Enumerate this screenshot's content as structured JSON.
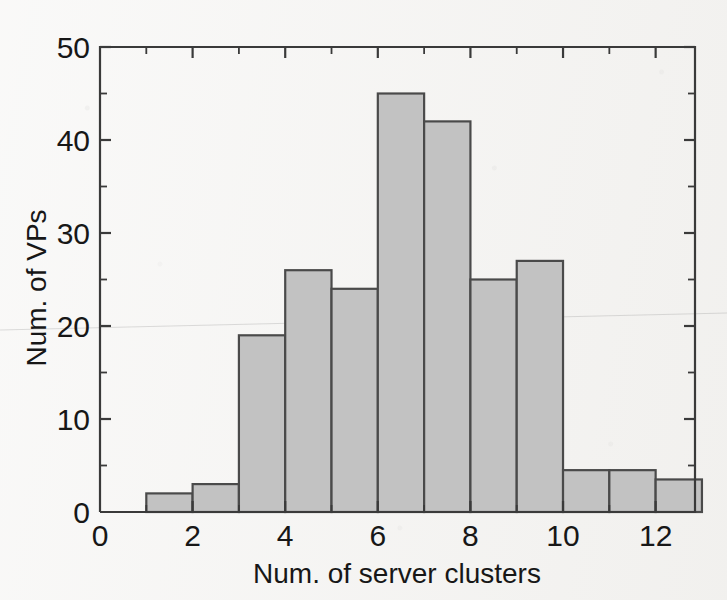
{
  "figure": {
    "background_color": "#f3f2f0",
    "bar_fill_color": "#c2c2c2",
    "bar_edge_color": "#4a4a4a",
    "axis_color": "#3a3a3a",
    "text_color": "#171717"
  },
  "chart_data": {
    "type": "bar",
    "title": "",
    "xlabel": "Num. of server clusters",
    "ylabel": "Num. of VPs",
    "xlim": [
      0,
      12.85
    ],
    "ylim": [
      0,
      50
    ],
    "xticks": [
      0,
      2,
      4,
      6,
      8,
      10,
      12
    ],
    "xtick_labels": [
      "0",
      "2",
      "4",
      "6",
      "8",
      "10",
      "12"
    ],
    "yticks": [
      0,
      10,
      20,
      30,
      40,
      50
    ],
    "ytick_labels": [
      "0",
      "10",
      "20",
      "30",
      "40",
      "50"
    ],
    "x_minor_ticks": [
      1,
      3,
      5,
      7,
      9,
      11
    ],
    "y_minor_ticks": [
      5,
      15,
      25,
      35,
      45
    ],
    "grid": false,
    "legend": null,
    "bin_width": 1,
    "bin_edges": [
      1,
      2,
      3,
      4,
      5,
      6,
      7,
      8,
      9,
      10,
      11,
      12,
      13
    ],
    "categories": [
      "1-2",
      "2-3",
      "3-4",
      "4-5",
      "5-6",
      "6-7",
      "7-8",
      "8-9",
      "9-10",
      "10-11",
      "11-12",
      "12-13"
    ],
    "bin_starts": [
      1,
      2,
      3,
      4,
      5,
      6,
      7,
      8,
      9,
      10,
      11,
      12
    ],
    "values": [
      2,
      3,
      19,
      26,
      24,
      45,
      42,
      25,
      27,
      4.5,
      4.5,
      3.5
    ]
  }
}
